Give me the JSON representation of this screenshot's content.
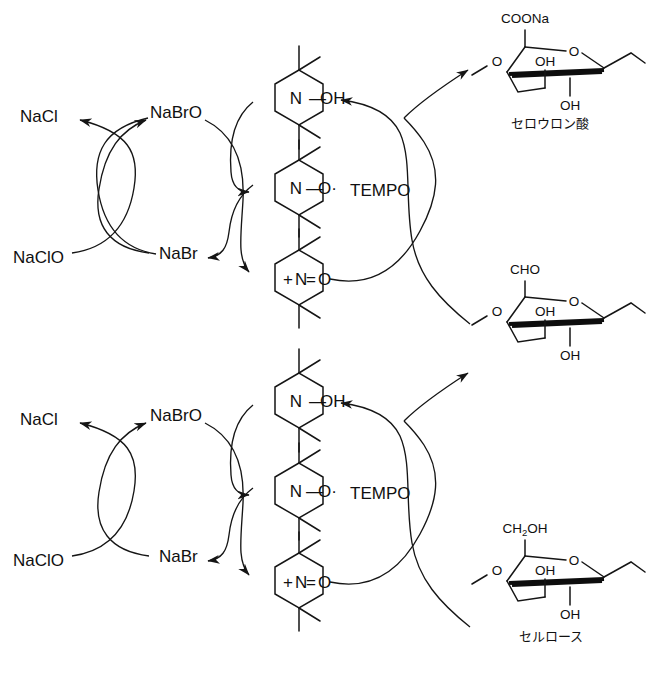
{
  "figure": {
    "background_color": "#ffffff",
    "line_color": "#151515",
    "width": 651,
    "height": 678
  },
  "cycles": [
    {
      "id": "upper-cycle",
      "chlorine_bromine_cycle": {
        "naclo": "NaClO",
        "nacl": "NaCl",
        "nabro": "NaBrO",
        "nabr": "NaBr"
      },
      "tempo_label": "TEMPO",
      "tempo_species": [
        {
          "id": "hydroxylamine",
          "nitrogen": "N",
          "bond": "—",
          "group": "OH",
          "charge": ""
        },
        {
          "id": "nitroxyl-radical",
          "nitrogen": "N",
          "bond": "—",
          "group": "O·",
          "charge": ""
        },
        {
          "id": "oxoammonium",
          "nitrogen": "N",
          "bond": "=",
          "group": "O",
          "charge": "+"
        }
      ],
      "sugar_top": {
        "id": "cellouronic-acid",
        "c6_substituent": "COONa",
        "ring_oxygen": "O",
        "glycosidic_oxygen": "O",
        "oh_upper": "OH",
        "oh_lower": "OH",
        "name_jp": "セロウロン酸"
      },
      "sugar_bottom": {
        "id": "aldehyde-intermediate",
        "c6_substituent": "CHO",
        "ring_oxygen": "O",
        "glycosidic_oxygen": "O",
        "oh_upper": "OH",
        "oh_lower": "OH",
        "name_jp": ""
      }
    },
    {
      "id": "lower-cycle",
      "chlorine_bromine_cycle": {
        "naclo": "NaClO",
        "nacl": "NaCl",
        "nabro": "NaBrO",
        "nabr": "NaBr"
      },
      "tempo_label": "TEMPO",
      "tempo_species": [
        {
          "id": "hydroxylamine",
          "nitrogen": "N",
          "bond": "—",
          "group": "OH",
          "charge": ""
        },
        {
          "id": "nitroxyl-radical",
          "nitrogen": "N",
          "bond": "—",
          "group": "O·",
          "charge": ""
        },
        {
          "id": "oxoammonium",
          "nitrogen": "N",
          "bond": "=",
          "group": "O",
          "charge": "+"
        }
      ],
      "sugar_top": {
        "id": "aldehyde-intermediate",
        "c6_substituent": "CHO",
        "ring_oxygen": "O",
        "glycosidic_oxygen": "O",
        "oh_upper": "OH",
        "oh_lower": "OH",
        "name_jp": ""
      },
      "sugar_bottom": {
        "id": "cellulose",
        "c6_substituent_pre": "CH",
        "c6_substituent_sub": "2",
        "c6_substituent_post": "OH",
        "ring_oxygen": "O",
        "glycosidic_oxygen": "O",
        "oh_upper": "OH",
        "oh_lower": "OH",
        "name_jp": "セルロース"
      }
    }
  ]
}
